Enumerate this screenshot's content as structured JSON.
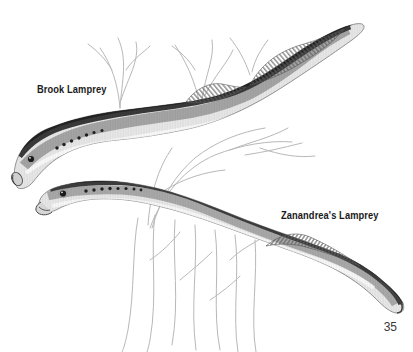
{
  "page": {
    "number": "35"
  },
  "figure": {
    "kind": "book-illustration",
    "species": [
      {
        "label": "Brook Lamprey"
      },
      {
        "label": "Zanandrea's Lamprey"
      }
    ],
    "artwork": [
      "brook-lamprey-drawing",
      "zanandrea-lamprey-drawing",
      "aquatic-plants-drawing"
    ]
  },
  "colors": {
    "background": "#ffffff",
    "label_text": "#1a1a1a",
    "page_number": "#3a3a3a",
    "plant": "#b5b5b5",
    "body_dark": "#2f2f2f",
    "body_mid": "#8f8f8f",
    "body_light": "#e8e8e8"
  }
}
